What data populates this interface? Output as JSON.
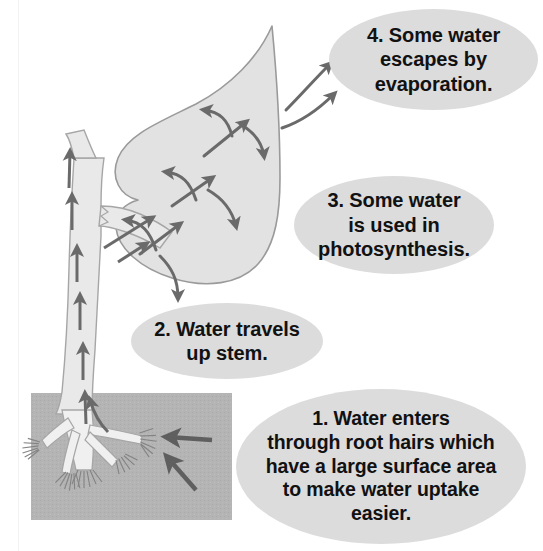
{
  "diagram": {
    "type": "biology-process-diagram",
    "colors": {
      "background": "#ffffff",
      "plant_fill": "#e2e2e2",
      "plant_outline": "#9a9a9a",
      "soil_fill": "#b4b4b4",
      "callout_fill": "#dcdcdc",
      "arrow": "#6a6a6a",
      "root_hair": "#808080",
      "text": "#111111"
    },
    "parts": [
      {
        "name": "stem",
        "label": "stem"
      },
      {
        "name": "leaf",
        "label": "leaf"
      },
      {
        "name": "roots",
        "label": "roots"
      },
      {
        "name": "soil",
        "label": "soil"
      }
    ]
  },
  "callouts": [
    {
      "id": "4",
      "number": "4.",
      "text": "4. Some water\nescapes by\nevaporation."
    },
    {
      "id": "3",
      "number": "3.",
      "text": "3. Some water\nis used in\nphotosynthesis."
    },
    {
      "id": "2",
      "number": "2.",
      "text": "2. Water travels\nup stem."
    },
    {
      "id": "1",
      "number": "1.",
      "text": "1. Water enters\nthrough root hairs which\nhave a large surface area\nto make water uptake\neasier."
    }
  ],
  "arrows": {
    "stem_up_count": "6",
    "leaf_internal_count": "9",
    "evaporation_count": "2",
    "root_uptake_count": "2",
    "stem_direction": "up",
    "evaporation_direction": "up-right",
    "root_direction": "into-roots"
  }
}
